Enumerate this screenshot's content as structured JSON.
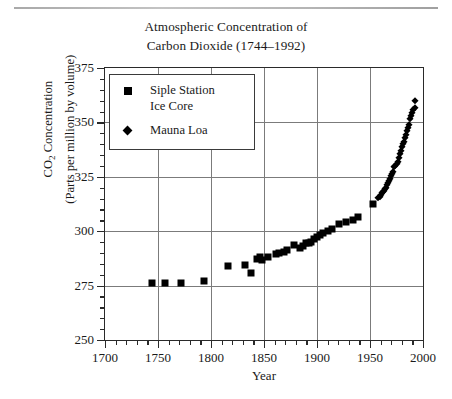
{
  "chart_data": {
    "type": "scatter",
    "title": "Atmospheric Concentration of Carbon Dioxide (1744–1992)",
    "title_lines": [
      "Atmospheric Concentration of",
      "Carbon Dioxide (1744–1992)"
    ],
    "xlabel": "Year",
    "ylabel": "CO2 Concentration (Parts per million by volume)",
    "ylabel_lines": [
      "CO2 Concentration",
      "(Parts per million by volume)"
    ],
    "xlim": [
      1700,
      2000
    ],
    "ylim": [
      250,
      375
    ],
    "xticks": [
      1700,
      1750,
      1800,
      1850,
      1900,
      1950,
      2000
    ],
    "yticks": [
      250,
      275,
      300,
      325,
      350,
      375
    ],
    "xtick_labels": [
      "1700",
      "1750",
      "1800",
      "1850",
      "1900",
      "1950",
      "2000"
    ],
    "ytick_labels": [
      "250",
      "275",
      "300",
      "325",
      "350",
      "375"
    ],
    "x_minor_step": 10,
    "y_minor_step": 5,
    "grid": true,
    "legend_position": "upper left",
    "marker_color": "#000000",
    "series": [
      {
        "name": "Siple Station Ice Core",
        "marker": "square",
        "points": [
          [
            1744,
            276.0
          ],
          [
            1757,
            276.0
          ],
          [
            1772,
            276.4
          ],
          [
            1793,
            277.0
          ],
          [
            1816,
            283.8
          ],
          [
            1832,
            284.3
          ],
          [
            1838,
            281.0
          ],
          [
            1843,
            287.0
          ],
          [
            1846,
            288.0
          ],
          [
            1848,
            286.6
          ],
          [
            1854,
            288.3
          ],
          [
            1861,
            289.6
          ],
          [
            1864,
            290.0
          ],
          [
            1869,
            290.5
          ],
          [
            1872,
            291.4
          ],
          [
            1878,
            293.8
          ],
          [
            1884,
            292.5
          ],
          [
            1887,
            293.0
          ],
          [
            1890,
            294.6
          ],
          [
            1892,
            294.8
          ],
          [
            1894,
            295.2
          ],
          [
            1897,
            296.6
          ],
          [
            1900,
            297.3
          ],
          [
            1903,
            298.2
          ],
          [
            1906,
            299.0
          ],
          [
            1910,
            300.2
          ],
          [
            1914,
            301.2
          ],
          [
            1921,
            303.4
          ],
          [
            1927,
            304.0
          ],
          [
            1934,
            305.0
          ],
          [
            1939,
            306.4
          ],
          [
            1953,
            312.6
          ]
        ]
      },
      {
        "name": "Mauna Loa",
        "marker": "diamond",
        "points": [
          [
            1958,
            315.2
          ],
          [
            1959,
            315.9
          ],
          [
            1960,
            316.7
          ],
          [
            1961,
            317.4
          ],
          [
            1962,
            318.1
          ],
          [
            1963,
            318.7
          ],
          [
            1964,
            319.3
          ],
          [
            1965,
            320.0
          ],
          [
            1966,
            321.2
          ],
          [
            1967,
            322.0
          ],
          [
            1968,
            322.9
          ],
          [
            1969,
            324.2
          ],
          [
            1970,
            325.3
          ],
          [
            1971,
            326.2
          ],
          [
            1972,
            327.4
          ],
          [
            1973,
            329.6
          ],
          [
            1974,
            330.1
          ],
          [
            1975,
            331.1
          ],
          [
            1976,
            332.0
          ],
          [
            1977,
            333.7
          ],
          [
            1978,
            335.3
          ],
          [
            1979,
            336.8
          ],
          [
            1980,
            338.7
          ],
          [
            1981,
            339.9
          ],
          [
            1982,
            341.1
          ],
          [
            1983,
            342.8
          ],
          [
            1984,
            344.4
          ],
          [
            1985,
            345.9
          ],
          [
            1986,
            347.2
          ],
          [
            1987,
            348.9
          ],
          [
            1988,
            351.5
          ],
          [
            1989,
            352.9
          ],
          [
            1990,
            354.2
          ],
          [
            1991,
            355.6
          ],
          [
            1992,
            356.4
          ],
          [
            1992,
            360.0
          ]
        ]
      }
    ],
    "legend": [
      {
        "label": "Siple Station\nIce Core",
        "marker": "square"
      },
      {
        "label": "Mauna Loa",
        "marker": "diamond"
      }
    ]
  }
}
